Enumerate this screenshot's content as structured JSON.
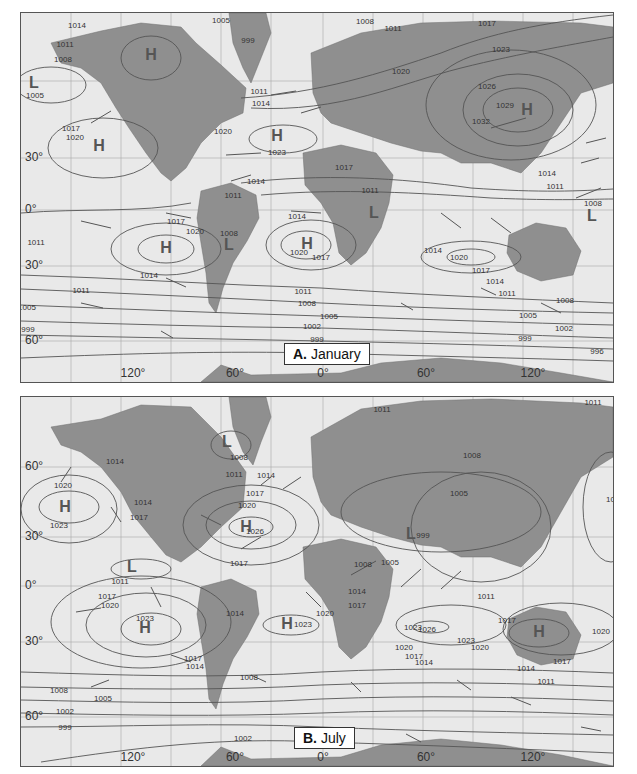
{
  "panels": {
    "a": {
      "letter": "A.",
      "title": "January",
      "lat_labels": [
        {
          "text": "30°",
          "y": 145
        },
        {
          "text": "0°",
          "y": 197
        },
        {
          "text": "30°",
          "y": 253
        },
        {
          "text": "60°",
          "y": 328
        }
      ],
      "lon_labels": [
        {
          "text": "120°",
          "x": 112
        },
        {
          "text": "60°",
          "x": 214
        },
        {
          "text": "0°",
          "x": 302
        },
        {
          "text": "60°",
          "x": 405
        },
        {
          "text": "120°",
          "x": 512
        }
      ],
      "centers": [
        {
          "type": "H",
          "x": 130,
          "y": 42
        },
        {
          "type": "L",
          "x": 13,
          "y": 70
        },
        {
          "type": "H",
          "x": 78,
          "y": 133
        },
        {
          "type": "H",
          "x": 256,
          "y": 123
        },
        {
          "type": "H",
          "x": 506,
          "y": 97
        },
        {
          "type": "H",
          "x": 145,
          "y": 235
        },
        {
          "type": "L",
          "x": 208,
          "y": 232
        },
        {
          "type": "H",
          "x": 286,
          "y": 231
        },
        {
          "type": "L",
          "x": 353,
          "y": 200
        },
        {
          "type": "L",
          "x": 571,
          "y": 203
        }
      ],
      "isobar_labels": [
        {
          "text": "1014",
          "x": 56,
          "y": 12
        },
        {
          "text": "1011",
          "x": 44,
          "y": 31
        },
        {
          "text": "1008",
          "x": 42,
          "y": 46
        },
        {
          "text": "1005",
          "x": 14,
          "y": 82
        },
        {
          "text": "1017",
          "x": 50,
          "y": 115
        },
        {
          "text": "1020",
          "x": 54,
          "y": 124
        },
        {
          "text": "1005",
          "x": 200,
          "y": 7
        },
        {
          "text": "999",
          "x": 227,
          "y": 27
        },
        {
          "text": "1011",
          "x": 238,
          "y": 78
        },
        {
          "text": "1014",
          "x": 240,
          "y": 90
        },
        {
          "text": "1020",
          "x": 202,
          "y": 118
        },
        {
          "text": "1023",
          "x": 256,
          "y": 139
        },
        {
          "text": "1014",
          "x": 235,
          "y": 168
        },
        {
          "text": "1011",
          "x": 212,
          "y": 182
        },
        {
          "text": "1008",
          "x": 344,
          "y": 8
        },
        {
          "text": "1011",
          "x": 372,
          "y": 15
        },
        {
          "text": "1017",
          "x": 466,
          "y": 10
        },
        {
          "text": "1020",
          "x": 380,
          "y": 58
        },
        {
          "text": "1023",
          "x": 480,
          "y": 36
        },
        {
          "text": "1026",
          "x": 466,
          "y": 73
        },
        {
          "text": "1029",
          "x": 484,
          "y": 92
        },
        {
          "text": "1032",
          "x": 460,
          "y": 108
        },
        {
          "text": "1017",
          "x": 323,
          "y": 154
        },
        {
          "text": "1011",
          "x": 349,
          "y": 177
        },
        {
          "text": "1014",
          "x": 526,
          "y": 160
        },
        {
          "text": "1011",
          "x": 534,
          "y": 173
        },
        {
          "text": "1008",
          "x": 572,
          "y": 190
        },
        {
          "text": "1017",
          "x": 155,
          "y": 208
        },
        {
          "text": "1020",
          "x": 174,
          "y": 218
        },
        {
          "text": "1011",
          "x": 15,
          "y": 229
        },
        {
          "text": "1014",
          "x": 128,
          "y": 262
        },
        {
          "text": "1011",
          "x": 60,
          "y": 277
        },
        {
          "text": "1008",
          "x": 208,
          "y": 220
        },
        {
          "text": "1014",
          "x": 276,
          "y": 203
        },
        {
          "text": "1020",
          "x": 278,
          "y": 239
        },
        {
          "text": "1017",
          "x": 300,
          "y": 244
        },
        {
          "text": "1011",
          "x": 282,
          "y": 278
        },
        {
          "text": "1008",
          "x": 286,
          "y": 290
        },
        {
          "text": "1005",
          "x": 308,
          "y": 303
        },
        {
          "text": "1002",
          "x": 291,
          "y": 313
        },
        {
          "text": "999",
          "x": 296,
          "y": 326
        },
        {
          "text": "996",
          "x": 302,
          "y": 338
        },
        {
          "text": "1014",
          "x": 412,
          "y": 237
        },
        {
          "text": "1020",
          "x": 438,
          "y": 244
        },
        {
          "text": "1017",
          "x": 460,
          "y": 257
        },
        {
          "text": "1014",
          "x": 474,
          "y": 268
        },
        {
          "text": "1011",
          "x": 486,
          "y": 280
        },
        {
          "text": "1008",
          "x": 544,
          "y": 287
        },
        {
          "text": "1005",
          "x": 507,
          "y": 302
        },
        {
          "text": "1002",
          "x": 543,
          "y": 315
        },
        {
          "text": "999",
          "x": 504,
          "y": 325
        },
        {
          "text": "996",
          "x": 576,
          "y": 338
        },
        {
          "text": "1005",
          "x": 6,
          "y": 294
        },
        {
          "text": "999",
          "x": 7,
          "y": 316
        }
      ]
    },
    "b": {
      "letter": "B.",
      "title": "July",
      "lat_labels": [
        {
          "text": "60°",
          "y": 70
        },
        {
          "text": "30°",
          "y": 140
        },
        {
          "text": "0°",
          "y": 189
        },
        {
          "text": "30°",
          "y": 245
        },
        {
          "text": "60°",
          "y": 320
        }
      ],
      "lon_labels": [
        {
          "text": "120°",
          "x": 112
        },
        {
          "text": "60°",
          "x": 214
        },
        {
          "text": "0°",
          "x": 302
        },
        {
          "text": "60°",
          "x": 405
        },
        {
          "text": "120°",
          "x": 512
        }
      ],
      "centers": [
        {
          "type": "L",
          "x": 206,
          "y": 45
        },
        {
          "type": "H",
          "x": 44,
          "y": 110
        },
        {
          "type": "H",
          "x": 225,
          "y": 130
        },
        {
          "type": "L",
          "x": 111,
          "y": 170
        },
        {
          "type": "H",
          "x": 124,
          "y": 231
        },
        {
          "type": "H",
          "x": 266,
          "y": 227
        },
        {
          "type": "L",
          "x": 390,
          "y": 137
        },
        {
          "type": "H",
          "x": 518,
          "y": 235
        }
      ],
      "isobar_labels": [
        {
          "text": "1008",
          "x": 218,
          "y": 60
        },
        {
          "text": "1014",
          "x": 94,
          "y": 64
        },
        {
          "text": "1020",
          "x": 42,
          "y": 88
        },
        {
          "text": "1023",
          "x": 38,
          "y": 128
        },
        {
          "text": "1014",
          "x": 122,
          "y": 105
        },
        {
          "text": "1017",
          "x": 118,
          "y": 120
        },
        {
          "text": "1011",
          "x": 213,
          "y": 77
        },
        {
          "text": "1014",
          "x": 245,
          "y": 78
        },
        {
          "text": "1017",
          "x": 234,
          "y": 96
        },
        {
          "text": "1020",
          "x": 226,
          "y": 108
        },
        {
          "text": "1026",
          "x": 234,
          "y": 134
        },
        {
          "text": "1017",
          "x": 218,
          "y": 166
        },
        {
          "text": "1011",
          "x": 99,
          "y": 184
        },
        {
          "text": "1011",
          "x": 361,
          "y": 12
        },
        {
          "text": "1008",
          "x": 451,
          "y": 58
        },
        {
          "text": "1005",
          "x": 438,
          "y": 96
        },
        {
          "text": "999",
          "x": 402,
          "y": 138
        },
        {
          "text": "1008",
          "x": 342,
          "y": 167
        },
        {
          "text": "1005",
          "x": 369,
          "y": 165
        },
        {
          "text": "1011",
          "x": 572,
          "y": 5
        },
        {
          "text": "1017",
          "x": 594,
          "y": 102
        },
        {
          "text": "1017",
          "x": 86,
          "y": 199
        },
        {
          "text": "1020",
          "x": 89,
          "y": 208
        },
        {
          "text": "1023",
          "x": 124,
          "y": 221
        },
        {
          "text": "1014",
          "x": 214,
          "y": 216
        },
        {
          "text": "1023",
          "x": 282,
          "y": 227
        },
        {
          "text": "1017",
          "x": 172,
          "y": 261
        },
        {
          "text": "1014",
          "x": 174,
          "y": 269
        },
        {
          "text": "1008",
          "x": 228,
          "y": 280
        },
        {
          "text": "1008",
          "x": 38,
          "y": 293
        },
        {
          "text": "1005",
          "x": 82,
          "y": 301
        },
        {
          "text": "1002",
          "x": 44,
          "y": 314
        },
        {
          "text": "999",
          "x": 44,
          "y": 330
        },
        {
          "text": "1002",
          "x": 222,
          "y": 341
        },
        {
          "text": "1014",
          "x": 336,
          "y": 194
        },
        {
          "text": "1017",
          "x": 336,
          "y": 208
        },
        {
          "text": "1020",
          "x": 304,
          "y": 216
        },
        {
          "text": "1023",
          "x": 392,
          "y": 230
        },
        {
          "text": "1026",
          "x": 406,
          "y": 232
        },
        {
          "text": "1011",
          "x": 465,
          "y": 199
        },
        {
          "text": "1017",
          "x": 486,
          "y": 223
        },
        {
          "text": "1023",
          "x": 445,
          "y": 243
        },
        {
          "text": "1020",
          "x": 459,
          "y": 250
        },
        {
          "text": "1020",
          "x": 383,
          "y": 250
        },
        {
          "text": "1017",
          "x": 393,
          "y": 259
        },
        {
          "text": "1014",
          "x": 403,
          "y": 265
        },
        {
          "text": "1014",
          "x": 505,
          "y": 271
        },
        {
          "text": "1011",
          "x": 525,
          "y": 284
        },
        {
          "text": "1017",
          "x": 541,
          "y": 264
        },
        {
          "text": "1020",
          "x": 580,
          "y": 234
        },
        {
          "text": "1014",
          "x": 609,
          "y": 220
        }
      ]
    }
  }
}
